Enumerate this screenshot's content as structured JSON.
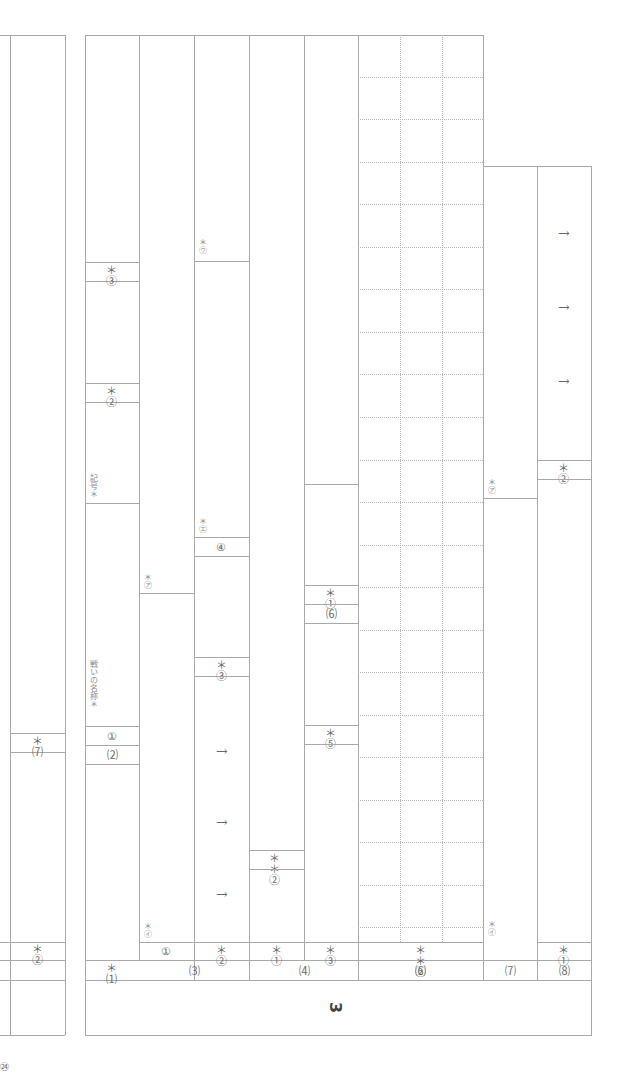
{
  "document": {
    "type": "answer-sheet",
    "orientation": "rotated-90",
    "page_number": "㉔",
    "section": "3"
  },
  "left_section": {
    "labels": {
      "q7": "＊⑺",
      "q2": "＊②"
    }
  },
  "section3": {
    "section_label": "3",
    "columns": [
      {
        "id": "1",
        "header": "＊⑴",
        "cells": [
          {
            "label": "＊③"
          },
          {
            "label": "＊②"
          },
          {
            "label": "記号＊"
          },
          {
            "label": "戦いの名称＊"
          },
          {
            "label": "①"
          },
          {
            "label": "⑵"
          }
        ]
      },
      {
        "id": "3-1",
        "header": "①",
        "cells": [
          {
            "label": "＊㋑"
          },
          {
            "label": "＊㋐"
          }
        ]
      },
      {
        "id": "3-2",
        "header": "＊②",
        "cells": [
          {
            "label": "＊㋒"
          },
          {
            "label": "＊㋓"
          },
          {
            "label": "④"
          },
          {
            "label": "＊③"
          }
        ],
        "arrows": [
          "→",
          "→",
          "→"
        ]
      },
      {
        "id": "4-1",
        "header": "＊①",
        "cells": [
          {
            "label": "＊＊②"
          }
        ]
      },
      {
        "id": "4-3",
        "header": "＊③",
        "cells": [
          {
            "label": "＊①"
          },
          {
            "label": "⑹"
          },
          {
            "label": "＊⑤"
          }
        ]
      },
      {
        "id": "6-2",
        "header": "＊＊②",
        "grid": {
          "rows": 22,
          "cols": 3
        }
      },
      {
        "id": "7",
        "header": "⑺",
        "cells": [
          {
            "label": "＊㋑"
          },
          {
            "label": "＊㋐"
          }
        ]
      },
      {
        "id": "8",
        "header": "⑻",
        "cells": [
          {
            "label": "＊①"
          },
          {
            "label": "＊②"
          }
        ],
        "arrows": [
          "→",
          "→",
          "→"
        ]
      }
    ],
    "group_labels": {
      "g3": "⑶",
      "g4": "⑷",
      "g6": "⑹",
      "g7": "⑺",
      "g8": "⑻",
      "g1": "＊⑴"
    },
    "row_item_labels": {
      "c1": "①",
      "c2": "＊②",
      "c3": "＊①",
      "c4": "＊③",
      "c5": "＊＊②",
      "c6": "＊㋑",
      "c7": "＊①"
    }
  }
}
